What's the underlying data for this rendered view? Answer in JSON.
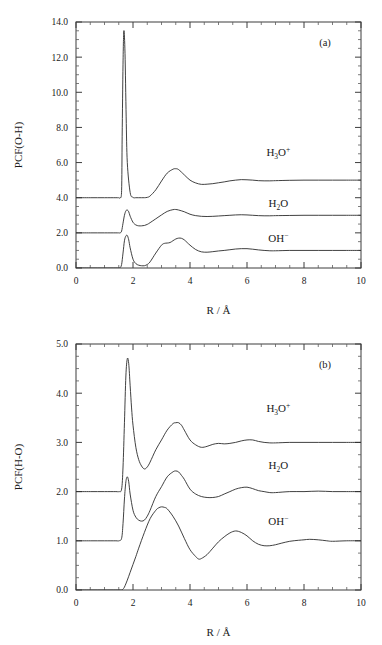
{
  "figure": {
    "panels": [
      {
        "id": "a",
        "panel_label": "(a)",
        "ylabel": "PCF(O-H)",
        "xlabel": "R / Å",
        "xticks": [
          "0",
          "2",
          "4",
          "6",
          "8",
          "10"
        ],
        "yticks": [
          "0.0",
          "2.0",
          "4.0",
          "6.0",
          "8.0",
          "10.0",
          "12.0",
          "14.0"
        ],
        "series_labels": [
          {
            "base": "H",
            "sub": "3",
            "base2": "O",
            "sup": "+",
            "text": "H3O+"
          },
          {
            "base": "H",
            "sub": "2",
            "base2": "O",
            "sup": "",
            "text": "H2O"
          },
          {
            "base": "OH",
            "sub": "",
            "base2": "",
            "sup": "−",
            "text": "OH-"
          }
        ]
      },
      {
        "id": "b",
        "panel_label": "(b)",
        "ylabel": "PCF(H-O)",
        "xlabel": "R / Å",
        "xticks": [
          "0",
          "2",
          "4",
          "6",
          "8",
          "10"
        ],
        "yticks": [
          "0.0",
          "1.0",
          "2.0",
          "3.0",
          "4.0",
          "5.0"
        ],
        "series_labels": [
          {
            "base": "H",
            "sub": "3",
            "base2": "O",
            "sup": "+",
            "text": "H3O+"
          },
          {
            "base": "H",
            "sub": "2",
            "base2": "O",
            "sup": "",
            "text": "H2O"
          },
          {
            "base": "OH",
            "sub": "",
            "base2": "",
            "sup": "−",
            "text": "OH-"
          }
        ]
      }
    ]
  },
  "chart_data": [
    {
      "type": "line",
      "panel": "a",
      "title": "",
      "xlabel": "R / Å",
      "ylabel": "PCF(O-H)",
      "xlim": [
        0,
        10
      ],
      "ylim": [
        0.0,
        14.0
      ],
      "xtick_values": [
        0,
        2,
        4,
        6,
        8,
        10
      ],
      "ytick_values": [
        0.0,
        2.0,
        4.0,
        6.0,
        8.0,
        10.0,
        12.0,
        14.0
      ],
      "xtick_minor_step": 0.5,
      "ytick_minor_step": 0.5,
      "grid": false,
      "legend_position": "inside-right",
      "annotations": [
        "(a)"
      ],
      "series": [
        {
          "name": "H3O+",
          "offset": 4.0,
          "label_x": 7.1,
          "label_y": 6.35,
          "x": [
            0.0,
            0.5,
            1.0,
            1.4,
            1.5,
            1.55,
            1.6,
            1.62,
            1.65,
            1.68,
            1.72,
            1.76,
            1.8,
            1.9,
            2.0,
            2.1,
            2.2,
            2.3,
            2.4,
            2.5,
            2.6,
            2.8,
            3.0,
            3.2,
            3.4,
            3.5,
            3.6,
            3.8,
            4.0,
            4.2,
            4.4,
            4.6,
            4.8,
            5.0,
            5.2,
            5.4,
            5.6,
            5.8,
            6.0,
            6.2,
            6.4,
            6.6,
            6.8,
            7.0,
            7.5,
            8.0,
            8.5,
            9.0,
            9.5,
            10.0
          ],
          "y": [
            4.0,
            4.0,
            4.0,
            4.0,
            4.0,
            4.0,
            4.4,
            7.5,
            11.6,
            13.5,
            12.2,
            8.6,
            6.0,
            4.3,
            4.02,
            4.0,
            4.0,
            4.0,
            4.0,
            4.02,
            4.1,
            4.45,
            4.95,
            5.4,
            5.62,
            5.65,
            5.6,
            5.3,
            5.0,
            4.84,
            4.76,
            4.77,
            4.8,
            4.85,
            4.9,
            4.96,
            5.0,
            5.03,
            5.02,
            5.0,
            4.97,
            4.96,
            4.96,
            4.97,
            4.99,
            5.0,
            5.0,
            5.0,
            5.0,
            5.0
          ]
        },
        {
          "name": "H2O",
          "offset": 2.0,
          "label_x": 7.1,
          "label_y": 3.45,
          "x": [
            0.0,
            0.5,
            1.0,
            1.4,
            1.5,
            1.55,
            1.6,
            1.65,
            1.7,
            1.75,
            1.8,
            1.85,
            1.9,
            2.0,
            2.1,
            2.2,
            2.3,
            2.4,
            2.5,
            2.6,
            2.8,
            3.0,
            3.2,
            3.4,
            3.5,
            3.6,
            3.8,
            4.0,
            4.2,
            4.4,
            4.6,
            4.8,
            5.0,
            5.2,
            5.4,
            5.6,
            5.8,
            6.0,
            6.2,
            6.4,
            6.6,
            6.8,
            7.0,
            7.5,
            8.0,
            8.5,
            9.0,
            9.5,
            10.0
          ],
          "y": [
            2.0,
            2.0,
            2.0,
            2.0,
            2.0,
            2.0,
            2.1,
            2.55,
            3.0,
            3.25,
            3.3,
            3.2,
            2.95,
            2.6,
            2.45,
            2.4,
            2.4,
            2.42,
            2.48,
            2.58,
            2.8,
            3.02,
            3.22,
            3.32,
            3.33,
            3.3,
            3.2,
            3.06,
            2.98,
            2.94,
            2.93,
            2.94,
            2.96,
            2.98,
            3.0,
            3.02,
            3.03,
            3.02,
            3.0,
            2.98,
            2.97,
            2.97,
            2.98,
            2.99,
            3.0,
            3.0,
            3.0,
            3.0,
            3.0
          ]
        },
        {
          "name": "OH-",
          "offset": 0.0,
          "label_x": 7.1,
          "label_y": 1.5,
          "x": [
            0.0,
            0.5,
            1.0,
            1.4,
            1.5,
            1.55,
            1.6,
            1.65,
            1.7,
            1.75,
            1.8,
            1.85,
            1.9,
            2.0,
            2.1,
            2.2,
            2.3,
            2.4,
            2.5,
            2.6,
            2.8,
            3.0,
            3.1,
            3.2,
            3.3,
            3.4,
            3.5,
            3.6,
            3.7,
            3.8,
            3.9,
            4.0,
            4.2,
            4.4,
            4.6,
            4.8,
            5.0,
            5.2,
            5.4,
            5.6,
            5.8,
            6.0,
            6.2,
            6.4,
            6.6,
            6.8,
            7.0,
            7.5,
            8.0,
            8.5,
            9.0,
            9.5,
            10.0
          ],
          "y": [
            0.0,
            0.0,
            0.0,
            0.0,
            0.0,
            0.02,
            0.2,
            0.85,
            1.55,
            1.82,
            1.85,
            1.6,
            1.15,
            0.5,
            0.25,
            0.16,
            0.13,
            0.13,
            0.2,
            0.35,
            0.85,
            1.3,
            1.4,
            1.42,
            1.45,
            1.55,
            1.65,
            1.7,
            1.69,
            1.6,
            1.45,
            1.3,
            1.05,
            0.92,
            0.9,
            0.93,
            0.97,
            1.0,
            1.04,
            1.08,
            1.1,
            1.1,
            1.07,
            1.03,
            1.0,
            0.98,
            0.98,
            1.0,
            1.0,
            1.0,
            1.0,
            1.0,
            1.0
          ]
        }
      ]
    },
    {
      "type": "line",
      "panel": "b",
      "title": "",
      "xlabel": "R / Å",
      "ylabel": "PCF(H-O)",
      "xlim": [
        0,
        10
      ],
      "ylim": [
        0.0,
        5.0
      ],
      "xtick_values": [
        0,
        2,
        4,
        6,
        8,
        10
      ],
      "ytick_values": [
        0.0,
        1.0,
        2.0,
        3.0,
        4.0,
        5.0
      ],
      "xtick_minor_step": 0.5,
      "ytick_minor_step": 0.25,
      "grid": false,
      "legend_position": "inside-right",
      "annotations": [
        "(b)"
      ],
      "series": [
        {
          "name": "H3O+",
          "offset": 2.0,
          "label_x": 7.1,
          "label_y": 3.62,
          "x": [
            0.0,
            0.5,
            1.0,
            1.4,
            1.5,
            1.6,
            1.65,
            1.7,
            1.75,
            1.8,
            1.85,
            1.9,
            1.95,
            2.0,
            2.1,
            2.2,
            2.3,
            2.4,
            2.5,
            2.6,
            2.8,
            3.0,
            3.2,
            3.4,
            3.5,
            3.6,
            3.7,
            3.8,
            4.0,
            4.2,
            4.4,
            4.6,
            4.8,
            5.0,
            5.2,
            5.4,
            5.6,
            5.8,
            6.0,
            6.2,
            6.4,
            6.6,
            6.8,
            7.0,
            7.5,
            8.0,
            8.5,
            9.0,
            9.5,
            10.0
          ],
          "y": [
            2.0,
            2.0,
            2.0,
            2.0,
            2.0,
            2.05,
            2.5,
            3.4,
            4.35,
            4.7,
            4.6,
            4.15,
            3.7,
            3.35,
            2.9,
            2.65,
            2.52,
            2.46,
            2.5,
            2.6,
            2.85,
            3.05,
            3.25,
            3.38,
            3.4,
            3.4,
            3.35,
            3.25,
            3.05,
            2.95,
            2.9,
            2.92,
            2.96,
            2.98,
            2.97,
            2.98,
            3.0,
            3.03,
            3.05,
            3.05,
            3.02,
            3.0,
            2.99,
            2.99,
            3.0,
            3.0,
            3.0,
            3.0,
            3.0,
            3.0
          ]
        },
        {
          "name": "H2O",
          "offset": 1.0,
          "label_x": 7.1,
          "label_y": 2.45,
          "x": [
            0.0,
            0.5,
            1.0,
            1.4,
            1.5,
            1.6,
            1.65,
            1.7,
            1.75,
            1.8,
            1.85,
            1.9,
            2.0,
            2.1,
            2.2,
            2.3,
            2.4,
            2.5,
            2.6,
            2.8,
            3.0,
            3.2,
            3.4,
            3.5,
            3.6,
            3.7,
            3.8,
            4.0,
            4.2,
            4.4,
            4.6,
            4.8,
            5.0,
            5.2,
            5.4,
            5.6,
            5.8,
            6.0,
            6.2,
            6.4,
            6.6,
            6.8,
            7.0,
            7.5,
            8.0,
            8.5,
            9.0,
            9.5,
            10.0
          ],
          "y": [
            1.0,
            1.0,
            1.0,
            1.0,
            1.0,
            1.05,
            1.35,
            1.85,
            2.2,
            2.3,
            2.2,
            1.95,
            1.62,
            1.48,
            1.42,
            1.4,
            1.42,
            1.5,
            1.62,
            1.9,
            2.1,
            2.3,
            2.4,
            2.42,
            2.4,
            2.33,
            2.25,
            2.05,
            1.95,
            1.9,
            1.88,
            1.88,
            1.9,
            1.95,
            2.0,
            2.05,
            2.08,
            2.09,
            2.06,
            2.02,
            2.0,
            1.98,
            1.98,
            2.0,
            2.0,
            2.01,
            2.0,
            2.0,
            2.0
          ]
        },
        {
          "name": "OH-",
          "offset": 0.0,
          "label_x": 7.1,
          "label_y": 1.32,
          "x": [
            0.0,
            0.5,
            1.0,
            1.4,
            1.5,
            1.6,
            1.65,
            1.7,
            1.8,
            1.9,
            2.0,
            2.1,
            2.2,
            2.4,
            2.6,
            2.8,
            2.9,
            3.0,
            3.1,
            3.2,
            3.4,
            3.6,
            3.8,
            4.0,
            4.2,
            4.3,
            4.4,
            4.6,
            4.8,
            5.0,
            5.2,
            5.4,
            5.6,
            5.8,
            6.0,
            6.2,
            6.4,
            6.6,
            6.8,
            7.0,
            7.2,
            7.5,
            7.8,
            8.0,
            8.2,
            8.5,
            8.8,
            9.0,
            9.5,
            10.0
          ],
          "y": [
            0.0,
            0.0,
            0.0,
            0.0,
            0.0,
            0.0,
            0.02,
            0.06,
            0.2,
            0.36,
            0.52,
            0.68,
            0.85,
            1.17,
            1.45,
            1.62,
            1.67,
            1.69,
            1.68,
            1.65,
            1.5,
            1.3,
            1.05,
            0.82,
            0.68,
            0.63,
            0.64,
            0.72,
            0.85,
            0.98,
            1.08,
            1.16,
            1.2,
            1.17,
            1.1,
            1.0,
            0.93,
            0.9,
            0.9,
            0.92,
            0.95,
            0.99,
            1.01,
            1.02,
            1.03,
            1.02,
            1.0,
            0.99,
            1.0,
            1.0
          ]
        }
      ]
    }
  ]
}
